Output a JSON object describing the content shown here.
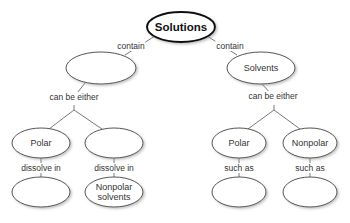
{
  "diagram": {
    "type": "concept-map",
    "root": {
      "id": "solutions",
      "label": "Solutions"
    },
    "nodes": [
      {
        "id": "solutions",
        "label": "Solutions",
        "cx": 181,
        "cy": 27,
        "rx": 34,
        "ry": 15
      },
      {
        "id": "blank-left",
        "label": "",
        "cx": 101,
        "cy": 68,
        "rx": 35,
        "ry": 16
      },
      {
        "id": "solvents",
        "label": "Solvents",
        "cx": 261,
        "cy": 68,
        "rx": 34,
        "ry": 16
      },
      {
        "id": "polar-left",
        "label": "Polar",
        "cx": 41,
        "cy": 143,
        "rx": 29,
        "ry": 15
      },
      {
        "id": "blank-mid",
        "label": "",
        "cx": 114,
        "cy": 143,
        "rx": 29,
        "ry": 15
      },
      {
        "id": "polar-right",
        "label": "Polar",
        "cx": 239,
        "cy": 143,
        "rx": 27,
        "ry": 15
      },
      {
        "id": "nonpolar",
        "label": "Nonpolar",
        "cx": 310,
        "cy": 143,
        "rx": 27,
        "ry": 15
      },
      {
        "id": "blank-b1",
        "label": "",
        "cx": 41,
        "cy": 192,
        "rx": 29,
        "ry": 15
      },
      {
        "id": "nonpolar-solvents",
        "label": "Nonpolar solvents",
        "cx": 114,
        "cy": 192,
        "rx": 29,
        "ry": 15
      },
      {
        "id": "blank-b3",
        "label": "",
        "cx": 239,
        "cy": 192,
        "rx": 27,
        "ry": 15
      },
      {
        "id": "blank-b4",
        "label": "",
        "cx": 310,
        "cy": 192,
        "rx": 27,
        "ry": 15
      }
    ],
    "links": {
      "contain_left": "contain",
      "contain_right": "contain",
      "either_left": "can be either",
      "either_right": "can be either",
      "dissolve_1": "dissolve in",
      "dissolve_2": "dissolve in",
      "such_1": "such as",
      "such_2": "such as"
    },
    "edges": [
      {
        "from": "solutions",
        "to": "blank-left",
        "label": "contain"
      },
      {
        "from": "solutions",
        "to": "solvents",
        "label": "contain"
      },
      {
        "from": "blank-left",
        "to": "polar-left",
        "label": "can be either"
      },
      {
        "from": "blank-left",
        "to": "blank-mid",
        "label": "can be either"
      },
      {
        "from": "solvents",
        "to": "polar-right",
        "label": "can be either"
      },
      {
        "from": "solvents",
        "to": "nonpolar",
        "label": "can be either"
      },
      {
        "from": "polar-left",
        "to": "blank-b1",
        "label": "dissolve in"
      },
      {
        "from": "blank-mid",
        "to": "nonpolar-solvents",
        "label": "dissolve in"
      },
      {
        "from": "polar-right",
        "to": "blank-b3",
        "label": "such as"
      },
      {
        "from": "nonpolar",
        "to": "blank-b4",
        "label": "such as"
      }
    ]
  },
  "labels": {
    "solutions": "Solutions",
    "solvents": "Solvents",
    "polar": "Polar",
    "nonpolar": "Nonpolar",
    "nonpolar_solvents_1": "Nonpolar",
    "nonpolar_solvents_2": "solvents"
  }
}
